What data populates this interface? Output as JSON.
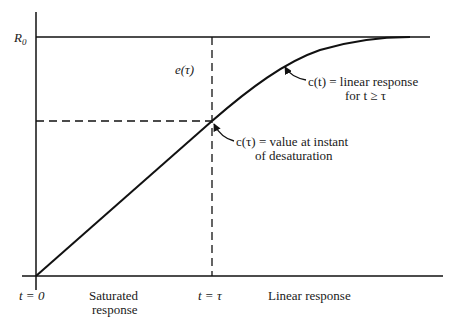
{
  "diagram": {
    "title": "",
    "colors": {
      "line": "#111111",
      "text": "#1a1a1a",
      "background": "#ffffff"
    },
    "y_axis_label": "R",
    "y_axis_label_sub": "0",
    "x_labels": {
      "t0": "t = 0",
      "ttau": "t = τ",
      "saturated_1": "Saturated",
      "saturated_2": "response",
      "linear": "Linear response"
    },
    "annotations": {
      "error": "e(τ)",
      "linear_1": "c(t) = linear response",
      "linear_2": "for t ≥ τ",
      "desat_1": "c(τ) = value at instant",
      "desat_2": "of desaturation"
    }
  }
}
